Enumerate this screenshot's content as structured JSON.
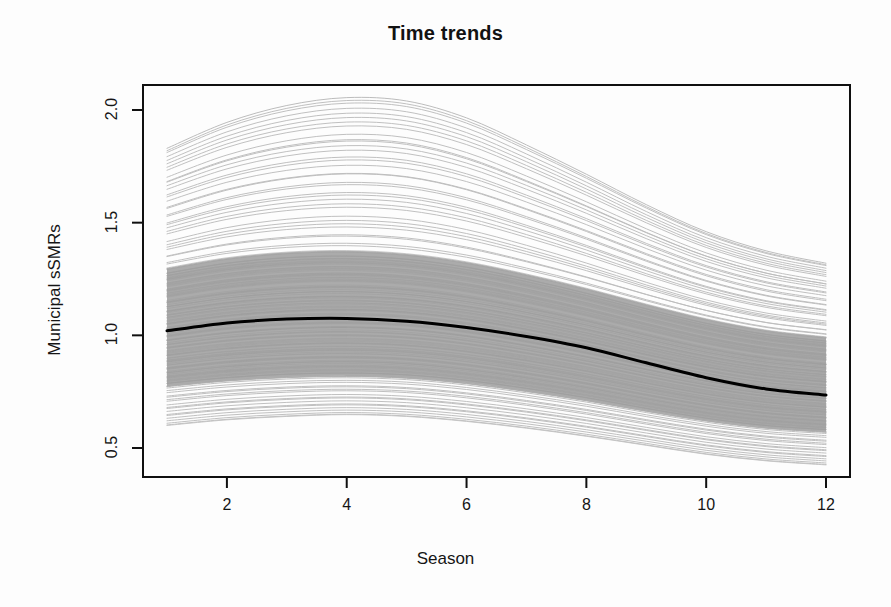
{
  "chart_data": {
    "type": "line",
    "title": "Time trends",
    "xlabel": "Season",
    "ylabel": "Municipal sSMRs",
    "xlim": [
      1,
      12
    ],
    "ylim": [
      0.38,
      2.1
    ],
    "grid": false,
    "legend": null,
    "x_ticks": [
      2,
      4,
      6,
      8,
      10,
      12
    ],
    "y_ticks": [
      0.5,
      1.0,
      1.5,
      2.0
    ],
    "x": [
      1,
      2,
      3,
      4,
      5,
      6,
      7,
      8,
      9,
      10,
      11,
      12
    ],
    "series": [
      {
        "name": "Overall median trend",
        "role": "median",
        "color": "#000000",
        "width": 3,
        "values": [
          1.02,
          1.055,
          1.072,
          1.075,
          1.063,
          1.035,
          0.995,
          0.945,
          0.878,
          0.812,
          0.762,
          0.735
        ]
      },
      {
        "name": "Municipal sSMR curves",
        "role": "envelope-upper",
        "color": "#b5b5b5",
        "width": 1,
        "values": [
          1.83,
          1.945,
          2.02,
          2.055,
          2.04,
          1.965,
          1.845,
          1.715,
          1.58,
          1.46,
          1.375,
          1.32
        ]
      },
      {
        "name": "Municipal sSMR curves",
        "role": "envelope-lower",
        "color": "#c2c2c2",
        "width": 1,
        "values": [
          0.6,
          0.625,
          0.64,
          0.648,
          0.64,
          0.618,
          0.588,
          0.552,
          0.512,
          0.472,
          0.443,
          0.425
        ]
      },
      {
        "name": "Dense band upper quantile",
        "role": "band-upper",
        "color": "#aaaaaa",
        "width": 1,
        "values": [
          1.295,
          1.34,
          1.365,
          1.372,
          1.358,
          1.322,
          1.268,
          1.205,
          1.135,
          1.07,
          1.02,
          0.99
        ]
      },
      {
        "name": "Dense band lower quantile",
        "role": "band-lower",
        "color": "#aaaaaa",
        "width": 1,
        "values": [
          0.775,
          0.8,
          0.815,
          0.82,
          0.812,
          0.788,
          0.753,
          0.712,
          0.665,
          0.622,
          0.59,
          0.572
        ]
      }
    ],
    "band": {
      "fill": "#ababab",
      "description": "Dense overlay of many municipality-specific seasonal curves"
    },
    "n_curves": 180,
    "axis_color": "#101010"
  }
}
